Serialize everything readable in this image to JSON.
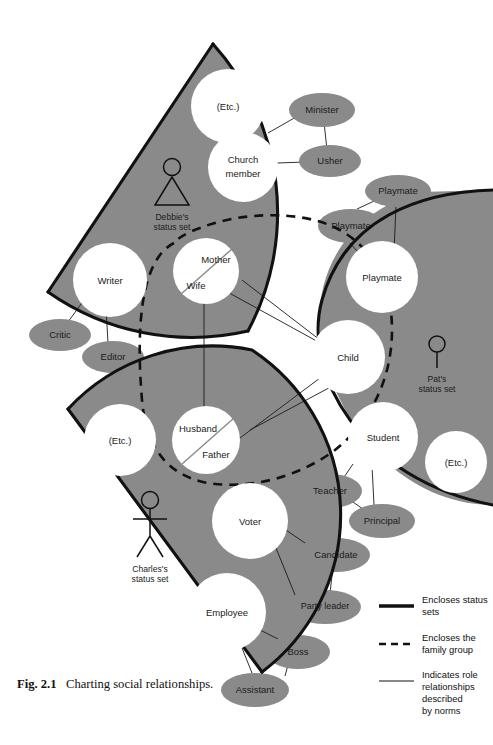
{
  "figure": {
    "caption_label": "Fig. 2.1",
    "caption_text": "Charting social relationships."
  },
  "colors": {
    "sector_fill": "#8a8a8a",
    "ellipse_fill": "#8a8a8a",
    "node_fill": "#ffffff",
    "outline": "#111111",
    "background": "#ffffff",
    "text": "#1b1b1b"
  },
  "status_sets": [
    {
      "id": "debbie",
      "name": "Debbie's",
      "line2": "status set",
      "icon": "female-figure-icon"
    },
    {
      "id": "pat",
      "name": "Pat's",
      "line2": "status set",
      "icon": "child-figure-icon"
    },
    {
      "id": "charles",
      "name": "Charles's",
      "line2": "status set",
      "icon": "male-figure-icon"
    }
  ],
  "nodes": {
    "debbie": [
      {
        "id": "d-etc",
        "label": "(Etc.)",
        "kind": "status-circle"
      },
      {
        "id": "d-church",
        "label": "Church",
        "label2": "member",
        "kind": "status-circle"
      },
      {
        "id": "d-writer",
        "label": "Writer",
        "kind": "status-circle"
      },
      {
        "id": "d-motherwife",
        "label": "Mother",
        "label2": "Wife",
        "kind": "status-circle-split"
      }
    ],
    "pat": [
      {
        "id": "p-playmate",
        "label": "Playmate",
        "kind": "status-circle"
      },
      {
        "id": "p-child",
        "label": "Child",
        "kind": "status-circle"
      },
      {
        "id": "p-student",
        "label": "Student",
        "kind": "status-circle"
      },
      {
        "id": "p-etc",
        "label": "(Etc.)",
        "kind": "status-circle"
      }
    ],
    "charles": [
      {
        "id": "c-etc",
        "label": "(Etc.)",
        "kind": "status-circle"
      },
      {
        "id": "c-husbandfather",
        "label": "Husband",
        "label2": "Father",
        "kind": "status-circle-split"
      },
      {
        "id": "c-voter",
        "label": "Voter",
        "kind": "status-circle"
      },
      {
        "id": "c-employee",
        "label": "Employee",
        "kind": "status-circle"
      }
    ]
  },
  "counter_roles": [
    {
      "id": "r-minister",
      "label": "Minister"
    },
    {
      "id": "r-usher",
      "label": "Usher"
    },
    {
      "id": "r-playmate-1",
      "label": "Playmate"
    },
    {
      "id": "r-playmate-2",
      "label": "Playmate"
    },
    {
      "id": "r-critic",
      "label": "Critic"
    },
    {
      "id": "r-editor",
      "label": "Editor"
    },
    {
      "id": "r-teacher",
      "label": "Teacher"
    },
    {
      "id": "r-principal",
      "label": "Principal"
    },
    {
      "id": "r-candidate",
      "label": "Candidate"
    },
    {
      "id": "r-party-leader",
      "label": "Party leader"
    },
    {
      "id": "r-boss",
      "label": "Boss"
    },
    {
      "id": "r-assistant",
      "label": "Assistant"
    }
  ],
  "legend": [
    {
      "id": "legend-status-sets",
      "swatch": "thick-solid-line",
      "lines": [
        "Encloses status",
        "sets"
      ]
    },
    {
      "id": "legend-family-group",
      "swatch": "dashed-line",
      "lines": [
        "Encloses the",
        "family group"
      ]
    },
    {
      "id": "legend-role-relationships",
      "swatch": "thin-solid-line",
      "lines": [
        "Indicates role",
        "relationships",
        "described",
        "by norms"
      ]
    }
  ]
}
